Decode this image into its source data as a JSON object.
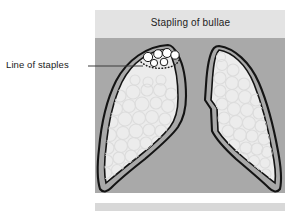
{
  "figure": {
    "name": "stapling-of-bullae-diagram",
    "panel": {
      "title": "Stapling of bullae",
      "header_band_color": "#e3e3e3",
      "body_background_color": "#a9a9a9",
      "bounds": {
        "x": 95,
        "y": 10,
        "width": 190,
        "height": 183
      },
      "header_height": 28
    },
    "next_panel": {
      "visible_sliver": true,
      "color": "#d8d8d8",
      "y": 203
    },
    "annotation": {
      "label": "Line of staples",
      "leader_line": {
        "x1": 88,
        "y1": 66,
        "x2": 143,
        "y2": 66,
        "color": "#3d3d3d"
      }
    },
    "colors": {
      "outline": "#141414",
      "lung_fill": "#ececec",
      "alveoli_stroke": "#dcdcdc",
      "bullae_fill": "#ffffff",
      "bullae_stroke": "#1a1a1a",
      "staple_line": "#1a1a1a",
      "page_background": "#ffffff"
    },
    "structures": [
      {
        "name": "left-lung",
        "side": "left",
        "has_bullae": true,
        "has_staple_line": true
      },
      {
        "name": "right-lung",
        "side": "right",
        "has_bullae": false,
        "has_staple_line": false
      }
    ],
    "bullae": {
      "count": 6,
      "description": "cluster of white air-filled bullae at lung apex"
    },
    "staple_line": {
      "style": "dotted",
      "description": "dotted line across apex beneath bullae"
    }
  }
}
